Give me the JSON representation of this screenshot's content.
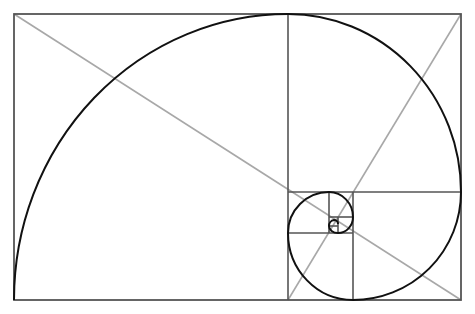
{
  "diagram": {
    "colors": {
      "background": "#ffffff",
      "frame": "#555555",
      "spiral": "#111111",
      "diagonal": "#a8a8a8"
    },
    "frame": {
      "x": 14,
      "y": 14,
      "width": 447,
      "height": 286
    },
    "dividers": [
      {
        "x1": 288,
        "y1": 14,
        "x2": 288,
        "y2": 300
      },
      {
        "x1": 288,
        "y1": 192,
        "x2": 461,
        "y2": 192
      },
      {
        "x1": 353,
        "y1": 192,
        "x2": 353,
        "y2": 300
      },
      {
        "x1": 288,
        "y1": 233,
        "x2": 353,
        "y2": 233
      },
      {
        "x1": 329,
        "y1": 192,
        "x2": 329,
        "y2": 233
      },
      {
        "x1": 329,
        "y1": 217,
        "x2": 353,
        "y2": 217
      },
      {
        "x1": 338,
        "y1": 217,
        "x2": 338,
        "y2": 233
      },
      {
        "x1": 329,
        "y1": 226,
        "x2": 338,
        "y2": 226
      }
    ],
    "diagonals": [
      {
        "x1": 14,
        "y1": 14,
        "x2": 461,
        "y2": 300
      },
      {
        "x1": 461,
        "y1": 14,
        "x2": 288,
        "y2": 300
      }
    ]
  }
}
